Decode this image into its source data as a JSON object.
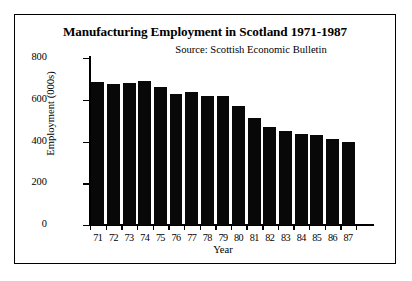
{
  "figure": {
    "title": "Manufacturing Employment in Scotland 1971-1987",
    "source": "Source: Scottish Economic Bulletin"
  },
  "chart_data": {
    "type": "bar",
    "title": "Manufacturing Employment in Scotland 1971-1987",
    "subtitle": "Source: Scottish Economic Bulletin",
    "xlabel": "Year",
    "ylabel": "Employment (000s)",
    "categories": [
      "71",
      "72",
      "73",
      "74",
      "75",
      "76",
      "77",
      "78",
      "79",
      "80",
      "81",
      "82",
      "83",
      "84",
      "85",
      "86",
      "87"
    ],
    "values": [
      685,
      675,
      680,
      690,
      660,
      630,
      635,
      620,
      617,
      570,
      515,
      470,
      450,
      437,
      432,
      410,
      400
    ],
    "ylim": [
      0,
      800
    ],
    "yticks": [
      0,
      200,
      400,
      600,
      800
    ],
    "ytick_labels": [
      "0",
      "200",
      "400",
      "600",
      "800"
    ],
    "grid": false,
    "legend": false,
    "bar_color": "#080808"
  }
}
